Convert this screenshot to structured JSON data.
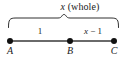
{
  "figure": {
    "type": "number-line-segment-diagram",
    "background_color": "#ffffff",
    "stroke_color": "#1a1a1a",
    "brace": {
      "label_x": "x",
      "label_rest": " (whole)",
      "label_full": "x (whole)",
      "spans_from": "A",
      "spans_to": "C"
    },
    "segments": [
      {
        "name": "segment-ab",
        "label": "1",
        "from": "A",
        "to": "B"
      },
      {
        "name": "segment-bc",
        "label": "x − 1",
        "label_x": "x",
        "label_rest": " − 1",
        "from": "B",
        "to": "C"
      }
    ],
    "points": [
      {
        "name": "point-a",
        "label": "A",
        "position_px": 10
      },
      {
        "name": "point-b",
        "label": "B",
        "position_px": 70
      },
      {
        "name": "point-c",
        "label": "C",
        "position_px": 114
      }
    ]
  }
}
